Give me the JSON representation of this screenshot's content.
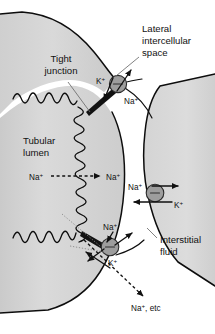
{
  "figure": {
    "background_color": "#ffffff",
    "cell_fill_color": "#d6d6d6",
    "outline_color": "#0d0d0d",
    "pump_color": "#9d9d9d",
    "leader_color": "#6b6b6b"
  },
  "annotations": [
    {
      "id": "tight-junction",
      "label_lines": [
        "Tight",
        "junction"
      ],
      "text": "Tight junction",
      "x": 61,
      "y": 62
    },
    {
      "id": "lateral-intercellular-space",
      "label_lines": [
        "Lateral",
        "intercellular",
        "space"
      ],
      "text": "Lateral intercellular space",
      "x": 142,
      "y": 30
    },
    {
      "id": "tubular-lumen",
      "label_lines": [
        "Tubular",
        "lumen"
      ],
      "text": "Tubular lumen",
      "x": 23,
      "y": 142
    },
    {
      "id": "interstitial-fluid",
      "label_lines": [
        "Interstitial",
        "fluid"
      ],
      "text": "Interstitial fluid",
      "x": 160,
      "y": 241
    }
  ],
  "ion_labels": [
    {
      "id": "k-top-pump",
      "ion": "K",
      "charge": "+",
      "text": "K+",
      "x": 98,
      "y": 83
    },
    {
      "id": "na-top-pump",
      "ion": "Na",
      "charge": "+",
      "text": "Na+",
      "x": 128,
      "y": 101
    },
    {
      "id": "na-lumen",
      "ion": "Na",
      "charge": "+",
      "text": "Na+",
      "x": 31,
      "y": 180
    },
    {
      "id": "na-cytosol",
      "ion": "Na",
      "charge": "+",
      "text": "Na+",
      "x": 107,
      "y": 180
    },
    {
      "id": "na-right-pump",
      "ion": "Na",
      "charge": "+",
      "text": "Na+",
      "x": 130,
      "y": 191
    },
    {
      "id": "k-right-pump",
      "ion": "K",
      "charge": "+",
      "text": "K+",
      "x": 175,
      "y": 208
    },
    {
      "id": "na-bottom-pump",
      "ion": "Na",
      "charge": "+",
      "text": "Na+",
      "x": 104,
      "y": 230
    },
    {
      "id": "k-bottom-pump",
      "ion": "K",
      "charge": "+",
      "text": "K+",
      "x": 109,
      "y": 265
    },
    {
      "id": "na-etc-paracellular",
      "ion": "Na",
      "charge": "+",
      "text": "Na+, etc",
      "x": 133,
      "y": 310
    }
  ],
  "pumps": [
    {
      "id": "pump-apical-lateral",
      "cx": 118,
      "cy": 84,
      "r": 8.6,
      "symbol": "ATPase"
    },
    {
      "id": "pump-basolateral",
      "cx": 155,
      "cy": 193,
      "r": 8.8,
      "symbol": "ATPase"
    },
    {
      "id": "pump-basal",
      "cx": 110,
      "cy": 247,
      "r": 8.8,
      "symbol": "ATPase"
    }
  ],
  "transport_arrows": [
    {
      "id": "na-entry-lumen-to-cell",
      "style": "dashed",
      "from": "lumen",
      "to": "cytosol",
      "ion": "Na+"
    },
    {
      "id": "na-out-top-pump",
      "style": "solid",
      "from": "cell",
      "to": "lateral-intercellular-space",
      "ion": "Na+"
    },
    {
      "id": "k-in-top-pump",
      "style": "solid",
      "from": "lateral-intercellular-space",
      "to": "cell",
      "ion": "K+"
    },
    {
      "id": "na-out-basolateral",
      "style": "solid",
      "from": "cell",
      "to": "interstitial-fluid",
      "ion": "Na+"
    },
    {
      "id": "k-in-basolateral",
      "style": "solid",
      "from": "interstitial-fluid",
      "to": "cell",
      "ion": "K+"
    },
    {
      "id": "na-out-basal",
      "style": "solid",
      "from": "cell",
      "to": "interstitial-fluid",
      "ion": "Na+"
    },
    {
      "id": "k-in-basal",
      "style": "solid",
      "from": "interstitial-fluid",
      "to": "cell",
      "ion": "K+"
    },
    {
      "id": "paracellular-flux",
      "style": "dashed",
      "from": "lumen",
      "to": "interstitial-fluid",
      "ion": "Na+, etc"
    }
  ]
}
